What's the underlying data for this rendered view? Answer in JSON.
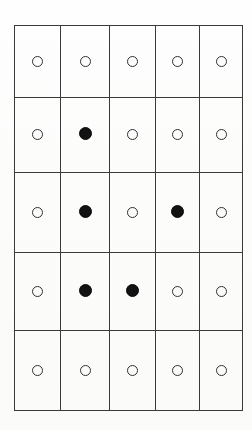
{
  "figure": {
    "background_color": "#fdfdfc",
    "grid_line_color": "#3a3a3a",
    "open_marker_color": "#303030",
    "filled_marker_color": "#121212"
  },
  "chart_data": {
    "type": "heatmap",
    "title": "",
    "xlabel": "",
    "ylabel": "",
    "rows": 5,
    "columns": 5,
    "legend": [
      {
        "key": "open",
        "label": "open circle",
        "value": 0
      },
      {
        "key": "filled",
        "label": "filled circle",
        "value": 1
      }
    ],
    "row_labels": [
      "1",
      "2",
      "3",
      "4",
      "5"
    ],
    "column_labels": [
      "1",
      "2",
      "3",
      "4",
      "5"
    ],
    "values": [
      [
        0,
        0,
        0,
        0,
        0
      ],
      [
        0,
        1,
        0,
        0,
        0
      ],
      [
        0,
        1,
        0,
        1,
        0
      ],
      [
        0,
        1,
        1,
        0,
        0
      ],
      [
        0,
        0,
        0,
        0,
        0
      ]
    ],
    "cells": [
      [
        {
          "state": "open"
        },
        {
          "state": "open"
        },
        {
          "state": "open"
        },
        {
          "state": "open"
        },
        {
          "state": "open"
        }
      ],
      [
        {
          "state": "open"
        },
        {
          "state": "filled"
        },
        {
          "state": "open"
        },
        {
          "state": "open"
        },
        {
          "state": "open"
        }
      ],
      [
        {
          "state": "open"
        },
        {
          "state": "filled"
        },
        {
          "state": "open"
        },
        {
          "state": "filled"
        },
        {
          "state": "open"
        }
      ],
      [
        {
          "state": "open"
        },
        {
          "state": "filled"
        },
        {
          "state": "filled"
        },
        {
          "state": "open"
        },
        {
          "state": "open"
        }
      ],
      [
        {
          "state": "open"
        },
        {
          "state": "open"
        },
        {
          "state": "open"
        },
        {
          "state": "open"
        },
        {
          "state": "open"
        }
      ]
    ],
    "filled_count": 5,
    "open_count": 20
  }
}
